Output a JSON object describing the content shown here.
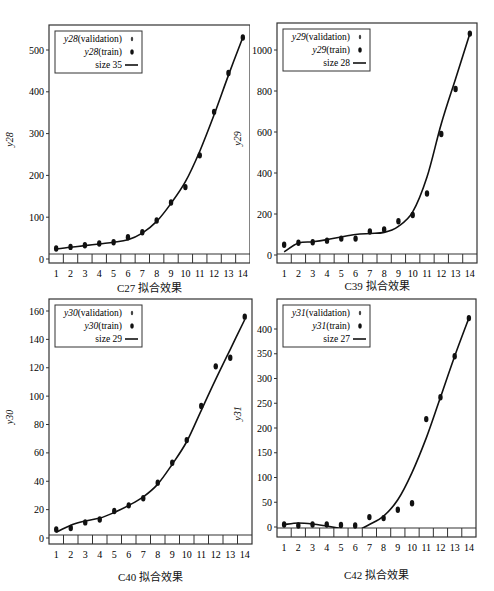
{
  "chart_data": [
    {
      "id": "c27",
      "type": "line",
      "caption": "C27  拟合效果",
      "ylabel": "y28",
      "categories": [
        1,
        2,
        3,
        4,
        5,
        6,
        7,
        8,
        9,
        10,
        11,
        12,
        13,
        14
      ],
      "yticks": [
        0,
        100,
        200,
        300,
        400,
        500
      ],
      "ylim": [
        -10,
        560
      ],
      "legend": [
        "y28(validation)",
        "y28(train)",
        "size 35"
      ],
      "legend_italic_prefix": "y28",
      "series": [
        {
          "name": "y28(train)",
          "kind": "points",
          "values": [
            25,
            29,
            33,
            37,
            40,
            52,
            64,
            92,
            135,
            172,
            248,
            352,
            445,
            530
          ]
        },
        {
          "name": "size 35",
          "kind": "line",
          "values": [
            24,
            28,
            32,
            36,
            40,
            46,
            62,
            90,
            133,
            185,
            258,
            345,
            440,
            530
          ]
        }
      ],
      "frame": {
        "x": 49,
        "y": 25,
        "w": 201,
        "h": 238,
        "zeroY": 259,
        "topY": 50,
        "topVal": 500
      }
    },
    {
      "id": "c39",
      "type": "line",
      "caption": "C39  拟合效果",
      "ylabel": "y29",
      "categories": [
        1,
        2,
        3,
        4,
        5,
        6,
        7,
        8,
        9,
        10,
        11,
        12,
        13,
        14
      ],
      "yticks": [
        0,
        200,
        400,
        600,
        800,
        1000
      ],
      "ylim": [
        -30,
        1110
      ],
      "legend": [
        "y29(validation)",
        "y29(train)",
        "size 28"
      ],
      "legend_italic_prefix": "y29",
      "series": [
        {
          "name": "y29(train)",
          "kind": "points",
          "values": [
            50,
            60,
            62,
            70,
            80,
            80,
            115,
            125,
            165,
            195,
            300,
            590,
            810,
            1080
          ]
        },
        {
          "name": "size 28",
          "kind": "line",
          "values": [
            15,
            58,
            65,
            75,
            88,
            100,
            105,
            110,
            140,
            210,
            380,
            640,
            860,
            1080
          ]
        }
      ],
      "frame": {
        "x": 277,
        "y": 23,
        "w": 200,
        "h": 240,
        "zeroY": 255,
        "topY": 50,
        "topVal": 1000
      }
    },
    {
      "id": "c40",
      "type": "line",
      "caption": "C40  拟合效果",
      "ylabel": "y30",
      "categories": [
        1,
        2,
        3,
        4,
        5,
        6,
        7,
        8,
        9,
        10,
        11,
        12,
        13,
        14
      ],
      "yticks": [
        0,
        20,
        40,
        60,
        80,
        100,
        120,
        140,
        160
      ],
      "ylim": [
        -4,
        166
      ],
      "legend": [
        "y30(validation)",
        "y30(train)",
        "size 29"
      ],
      "legend_italic_prefix": "y30",
      "series": [
        {
          "name": "y30(train)",
          "kind": "points",
          "values": [
            6,
            7,
            11,
            13,
            19,
            23,
            28,
            39,
            53,
            69,
            93,
            121,
            127,
            156
          ]
        },
        {
          "name": "size 29",
          "kind": "line",
          "values": [
            4,
            9,
            12,
            14,
            18,
            23,
            29,
            38,
            52,
            68,
            90,
            112,
            133,
            154
          ]
        }
      ],
      "frame": {
        "x": 49,
        "y": 299,
        "w": 203,
        "h": 245,
        "zeroY": 538,
        "topY": 311,
        "topVal": 160
      }
    },
    {
      "id": "c42",
      "type": "line",
      "caption": "C42  拟合效果",
      "ylabel": "y31",
      "categories": [
        1,
        2,
        3,
        4,
        5,
        6,
        7,
        8,
        9,
        10,
        11,
        12,
        13,
        14
      ],
      "yticks": [
        0,
        50,
        100,
        150,
        200,
        250,
        300,
        350,
        400
      ],
      "ylim": [
        -25,
        440
      ],
      "legend": [
        "y31(validation)",
        "y31(train)",
        "size 27"
      ],
      "legend_italic_prefix": "y31",
      "series": [
        {
          "name": "y31(train)",
          "kind": "points",
          "values": [
            5,
            3,
            5,
            5,
            4,
            3,
            20,
            18,
            35,
            48,
            218,
            262,
            345,
            422
          ]
        },
        {
          "name": "size 27",
          "kind": "line",
          "values": [
            5,
            8,
            6,
            2,
            -3,
            -8,
            5,
            22,
            55,
            110,
            180,
            262,
            345,
            422
          ]
        }
      ],
      "frame": {
        "x": 277,
        "y": 299,
        "w": 199,
        "h": 238,
        "zeroY": 527,
        "topY": 329,
        "topVal": 400
      }
    }
  ]
}
